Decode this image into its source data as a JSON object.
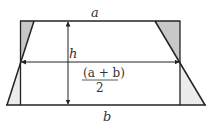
{
  "diagram": {
    "labels": {
      "top_side": "a",
      "height": "h",
      "midline": "(a + b)",
      "midline_denominator": "2",
      "bottom_side": "b"
    },
    "colors": {
      "stroke": "#222222",
      "shaded_dark": "#c8c8c8",
      "shaded_light": "#ececec",
      "background": "#ffffff"
    }
  }
}
